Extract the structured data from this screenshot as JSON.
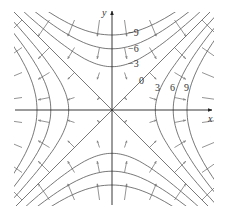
{
  "figure": {
    "axes": {
      "x_label": "x",
      "y_label": "y"
    },
    "origin_px": [
      112,
      110
    ],
    "scale_px_per_unit": 25,
    "xlim": [
      -3.9,
      4.0
    ],
    "ylim": [
      -3.8,
      3.9
    ],
    "level_values": [
      -9,
      -6,
      -3,
      0,
      3,
      6,
      9
    ],
    "level_labels": [
      {
        "text": "−9",
        "x": 128,
        "y": 36
      },
      {
        "text": "−6",
        "x": 128,
        "y": 52
      },
      {
        "text": "−3",
        "x": 128,
        "y": 67
      },
      {
        "text": "0",
        "x": 139,
        "y": 84
      },
      {
        "text": "3",
        "x": 155,
        "y": 91
      },
      {
        "text": "6",
        "x": 170,
        "y": 91
      },
      {
        "text": "9",
        "x": 184,
        "y": 91
      }
    ],
    "arrow_grid": [
      -3.6,
      -2.5,
      -1.5,
      -0.5,
      0.5,
      1.5,
      2.5,
      3.6
    ],
    "arrow_scale": 0.09,
    "colors": {
      "curve": "#555555",
      "axis": "#222222",
      "arrow": "#666666"
    }
  }
}
